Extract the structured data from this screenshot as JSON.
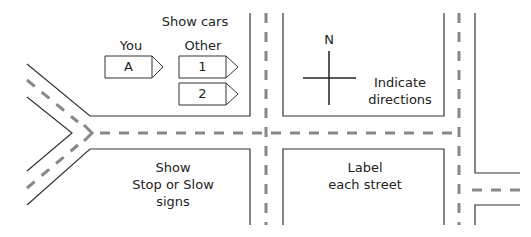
{
  "diagram": {
    "type": "street-map-worksheet",
    "instructions": {
      "show_cars": "Show cars",
      "stop_slow": [
        "Show",
        "Stop or Slow",
        "signs"
      ],
      "directions": [
        "Indicate",
        "directions"
      ],
      "label_streets": [
        "Label",
        "each street"
      ]
    },
    "cars": {
      "you_label": "You",
      "other_label": "Other",
      "you": [
        {
          "id": "A"
        }
      ],
      "other": [
        {
          "id": "1"
        },
        {
          "id": "2"
        }
      ]
    },
    "compass": {
      "north_label": "N"
    },
    "colors": {
      "line": "#333333",
      "lane_dash": "#888888",
      "background": "#ffffff"
    }
  }
}
